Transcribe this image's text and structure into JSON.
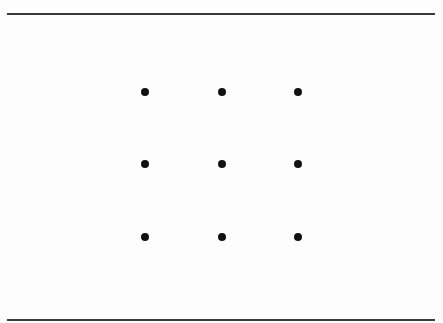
{
  "figure": {
    "rows": 3,
    "columns": 3,
    "dot_color": "#111111",
    "rule_color": "#3a3a3a",
    "dots": [
      {
        "row": 1,
        "col": 1
      },
      {
        "row": 1,
        "col": 2
      },
      {
        "row": 1,
        "col": 3
      },
      {
        "row": 2,
        "col": 1
      },
      {
        "row": 2,
        "col": 2
      },
      {
        "row": 2,
        "col": 3
      },
      {
        "row": 3,
        "col": 1
      },
      {
        "row": 3,
        "col": 2
      },
      {
        "row": 3,
        "col": 3
      }
    ]
  }
}
